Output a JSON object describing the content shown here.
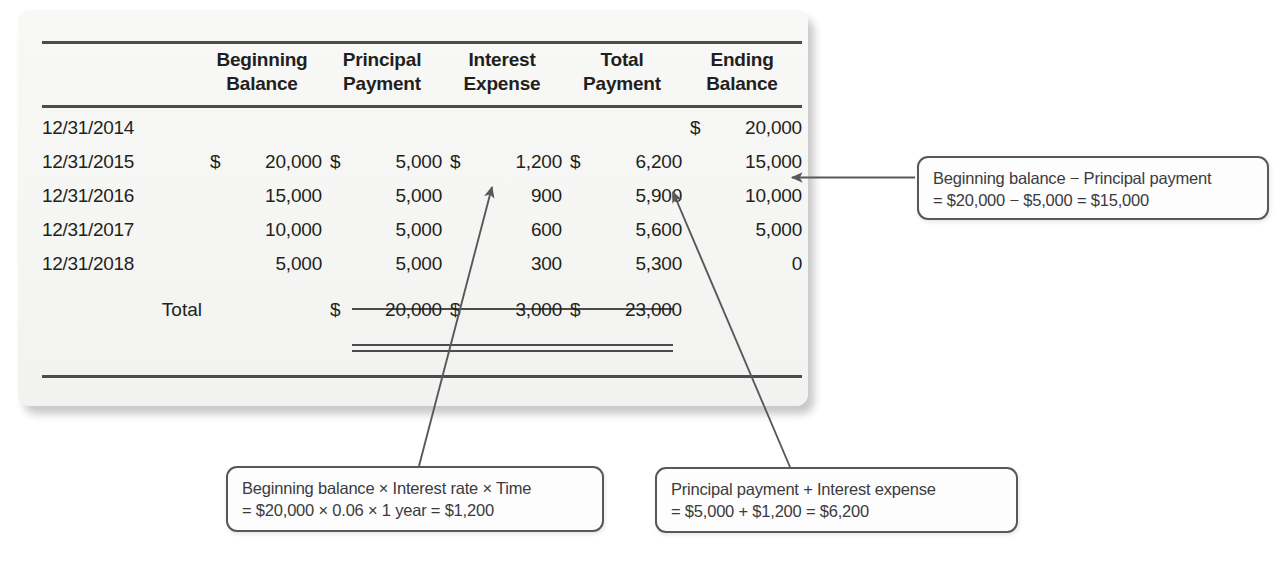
{
  "table": {
    "columns": [
      {
        "key": "date",
        "label_line1": "",
        "label_line2": ""
      },
      {
        "key": "beginning",
        "label_line1": "Beginning",
        "label_line2": "Balance"
      },
      {
        "key": "principal",
        "label_line1": "Principal",
        "label_line2": "Payment"
      },
      {
        "key": "interest",
        "label_line1": "Interest",
        "label_line2": "Expense"
      },
      {
        "key": "totalpay",
        "label_line1": "Total",
        "label_line2": "Payment"
      },
      {
        "key": "ending",
        "label_line1": "Ending",
        "label_line2": "Balance"
      }
    ],
    "rows": [
      {
        "date": "12/31/2014",
        "beginning_cur": "",
        "beginning": "",
        "principal_cur": "",
        "principal": "",
        "interest_cur": "",
        "interest": "",
        "totalpay_cur": "",
        "totalpay": "",
        "ending_cur": "$",
        "ending": "20,000"
      },
      {
        "date": "12/31/2015",
        "beginning_cur": "$",
        "beginning": "20,000",
        "principal_cur": "$",
        "principal": "5,000",
        "interest_cur": "$",
        "interest": "1,200",
        "totalpay_cur": "$",
        "totalpay": "6,200",
        "ending_cur": "",
        "ending": "15,000"
      },
      {
        "date": "12/31/2016",
        "beginning_cur": "",
        "beginning": "15,000",
        "principal_cur": "",
        "principal": "5,000",
        "interest_cur": "",
        "interest": "900",
        "totalpay_cur": "",
        "totalpay": "5,900",
        "ending_cur": "",
        "ending": "10,000"
      },
      {
        "date": "12/31/2017",
        "beginning_cur": "",
        "beginning": "10,000",
        "principal_cur": "",
        "principal": "5,000",
        "interest_cur": "",
        "interest": "600",
        "totalpay_cur": "",
        "totalpay": "5,600",
        "ending_cur": "",
        "ending": "5,000"
      },
      {
        "date": "12/31/2018",
        "beginning_cur": "",
        "beginning": "5,000",
        "principal_cur": "",
        "principal": "5,000",
        "interest_cur": "",
        "interest": "300",
        "totalpay_cur": "",
        "totalpay": "5,300",
        "ending_cur": "",
        "ending": "0"
      }
    ],
    "total_row": {
      "label": "Total",
      "beginning_cur": "",
      "beginning": "",
      "principal_cur": "$",
      "principal": "20,000",
      "interest_cur": "$",
      "interest": "3,000",
      "totalpay_cur": "$",
      "totalpay": "23,000",
      "ending_cur": "",
      "ending": ""
    }
  },
  "callouts": {
    "ending_balance": {
      "line1": "Beginning balance − Principal payment",
      "line2": "= $20,000 − $5,000 = $15,000"
    },
    "interest_expense": {
      "line1": "Beginning balance × Interest rate × Time",
      "line2": "= $20,000 × 0.06 × 1 year = $1,200"
    },
    "total_payment": {
      "line1": "Principal payment + Interest expense",
      "line2": "= $5,000 + $1,200 = $6,200"
    }
  },
  "colors": {
    "rule": "#4c4c4c",
    "card_background": "#f7f7f5",
    "callout_border": "#58585a",
    "text": "#231f20",
    "arrow": "#58585a"
  }
}
